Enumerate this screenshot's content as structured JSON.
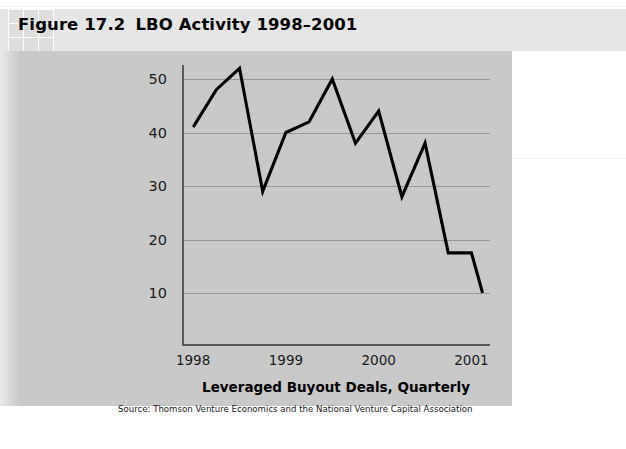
{
  "figure": {
    "label": "Figure 17.2",
    "title": "LBO Activity 1998–2001",
    "source": "Source: Thomson Venture Economics and the National Venture Capital Association"
  },
  "colors": {
    "panel_background": "#c9c9c9",
    "title_band": "#e6e6e6",
    "line": "#000000",
    "gridline": "#9a9a9a",
    "axis": "#5a5a5a",
    "page_background": "#ffffff"
  },
  "chart_data": {
    "type": "line",
    "title": "LBO Activity 1998–2001",
    "xlabel": "Leveraged Buyout Deals, Quarterly",
    "ylabel": "",
    "xlim": [
      1997.88,
      2001.2
    ],
    "ylim": [
      0,
      55
    ],
    "grid": true,
    "legend": null,
    "ytick_labels": [
      "50",
      "40",
      "30",
      "20",
      "10"
    ],
    "ytick_values": [
      50,
      40,
      30,
      20,
      10
    ],
    "xtick_labels": [
      "1998",
      "1999",
      "2000",
      "2001"
    ],
    "xtick_values": [
      1998,
      1999,
      2000,
      2001
    ],
    "x": [
      1998.0,
      1998.25,
      1998.5,
      1998.75,
      1999.0,
      1999.25,
      1999.5,
      1999.75,
      2000.0,
      2000.25,
      2000.5,
      2000.75,
      2001.0,
      2001.12
    ],
    "series": [
      {
        "name": "Leveraged Buyout Deals, Quarterly",
        "values": [
          41,
          48,
          52,
          29,
          40,
          42,
          50,
          38,
          44,
          28,
          38,
          17.5,
          17.5,
          10
        ]
      }
    ]
  }
}
